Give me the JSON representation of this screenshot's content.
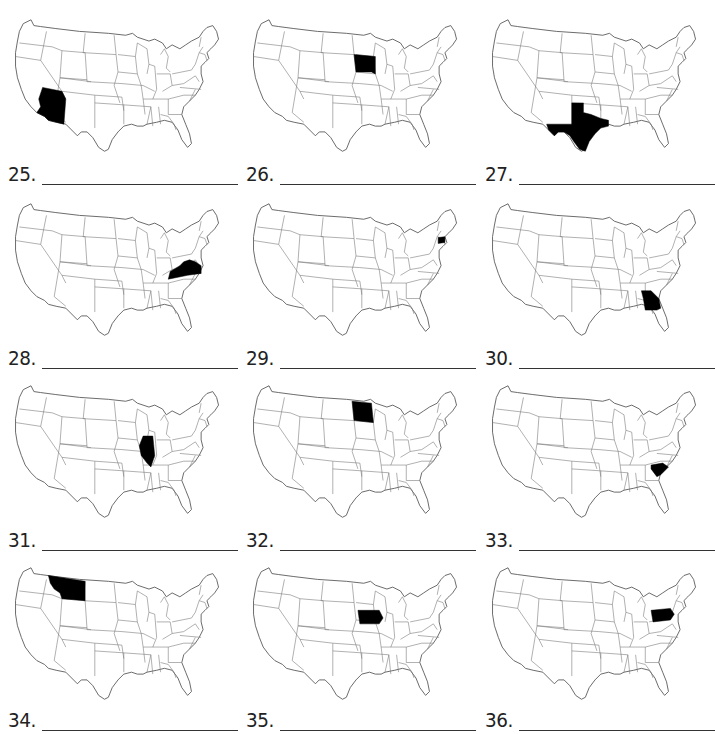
{
  "worksheet": {
    "instruction_fragment": "",
    "items": [
      {
        "number": "25.",
        "highlighted_state": "Arizona",
        "answer": ""
      },
      {
        "number": "26.",
        "highlighted_state": "South Dakota",
        "answer": ""
      },
      {
        "number": "27.",
        "highlighted_state": "Texas",
        "answer": ""
      },
      {
        "number": "28.",
        "highlighted_state": "Virginia",
        "answer": ""
      },
      {
        "number": "29.",
        "highlighted_state": "Connecticut",
        "answer": ""
      },
      {
        "number": "30.",
        "highlighted_state": "Georgia",
        "answer": ""
      },
      {
        "number": "31.",
        "highlighted_state": "Illinois",
        "answer": ""
      },
      {
        "number": "32.",
        "highlighted_state": "North Dakota",
        "answer": ""
      },
      {
        "number": "33.",
        "highlighted_state": "South Carolina",
        "answer": ""
      },
      {
        "number": "34.",
        "highlighted_state": "Montana",
        "answer": ""
      },
      {
        "number": "35.",
        "highlighted_state": "Iowa",
        "answer": ""
      },
      {
        "number": "36.",
        "highlighted_state": "Pennsylvania",
        "answer": ""
      }
    ]
  },
  "colors": {
    "highlight": "#000000",
    "outline": "#555555",
    "background": "#ffffff"
  }
}
